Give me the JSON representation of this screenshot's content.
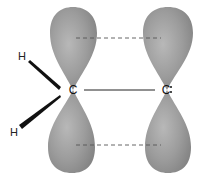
{
  "diagram": {
    "atoms": [
      {
        "id": "c_left",
        "label": "C",
        "x": 73,
        "y": 90
      },
      {
        "id": "c_right",
        "label": "C",
        "x": 167,
        "y": 90,
        "marker": "radical-dots"
      },
      {
        "id": "h_top",
        "label": "H",
        "x": 22,
        "y": 60
      },
      {
        "id": "h_bottom",
        "label": "H",
        "x": 14,
        "y": 136
      }
    ],
    "bonds": [
      {
        "type": "sigma",
        "from": "c_left",
        "to": "c_right",
        "style": "solid"
      },
      {
        "type": "wedge",
        "from": "h_top",
        "to": "c_left"
      },
      {
        "type": "wedge",
        "from": "c_left",
        "to": "h_bottom"
      }
    ],
    "orbitals": [
      {
        "atom": "c_left",
        "type": "p",
        "lobes": [
          "top",
          "bottom"
        ]
      },
      {
        "atom": "c_right",
        "type": "p",
        "lobes": [
          "top",
          "bottom"
        ]
      }
    ],
    "overlap_lines": [
      {
        "position": "top",
        "style": "dashed"
      },
      {
        "position": "bottom",
        "style": "dashed"
      }
    ],
    "colors": {
      "lobe_fill": "#9a9a9a",
      "lobe_highlight": "#bdbdbd",
      "lobe_shadow": "#7a7a7a",
      "line": "#333333",
      "dash": "#555555",
      "background": "#ffffff"
    }
  }
}
